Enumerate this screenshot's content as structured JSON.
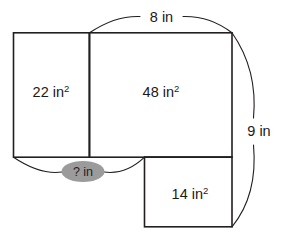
{
  "figure": {
    "background_color": "#ffffff",
    "line_color": "#231f20",
    "text_color": "#1a1a1a",
    "callout_fill_color": "#9b9b9b",
    "unit": "in"
  },
  "regions": [
    {
      "id": "left-rectangle",
      "area_label": "22 in²",
      "value": 22,
      "value_text": "22",
      "unit_text": "in",
      "superscript": "2"
    },
    {
      "id": "middle-rectangle",
      "area_label": "48 in²",
      "value": 48,
      "value_text": "48",
      "unit_text": "in",
      "superscript": "2"
    },
    {
      "id": "bottom-right-rectangle",
      "area_label": "14 in²",
      "value": 14,
      "value_text": "14",
      "unit_text": "in",
      "superscript": "2"
    }
  ],
  "dimensions": [
    {
      "id": "top-width",
      "label": "8 in",
      "value_text": "8",
      "unit_text": "in",
      "position": "top",
      "known": true
    },
    {
      "id": "right-height",
      "label": "9 in",
      "value_text": "9",
      "unit_text": "in",
      "position": "right",
      "known": true
    },
    {
      "id": "bottom-unknown-width",
      "label": "? in",
      "value_text": "?",
      "unit_text": "in",
      "position": "bottom",
      "known": false,
      "highlighted": true
    }
  ]
}
